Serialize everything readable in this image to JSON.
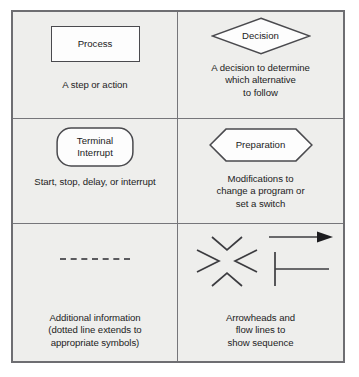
{
  "figure": {
    "type": "flowchart-symbol-reference-table",
    "background_color": "#eeeeec",
    "border_color": "#6e6e72",
    "shape_fill_color": "#fdfdfd",
    "text_color": "#1c1c1c"
  },
  "cells": [
    {
      "id": "process",
      "shape": "rectangle",
      "shape_label": "Process",
      "caption": "A step or action"
    },
    {
      "id": "decision",
      "shape": "diamond",
      "shape_label": "Decision",
      "caption": "A decision to determine\nwhich alternative\nto follow"
    },
    {
      "id": "terminal-interrupt",
      "shape": "stadium",
      "shape_label": "Terminal\nInterrupt",
      "caption": "Start, stop, delay, or interrupt"
    },
    {
      "id": "preparation",
      "shape": "hexagon",
      "shape_label": "Preparation",
      "caption": "Modifications to\nchange a program or\nset a switch"
    },
    {
      "id": "additional-information",
      "shape": "dotted-line",
      "shape_label": "",
      "caption": "Additional information\n(dotted line extends to\nappropriate symbols)"
    },
    {
      "id": "arrowheads-flow-lines",
      "shape": "arrowheads-and-flow-lines",
      "shape_label": "",
      "caption": "Arrowheads and\nflow lines to\nshow sequence"
    }
  ]
}
